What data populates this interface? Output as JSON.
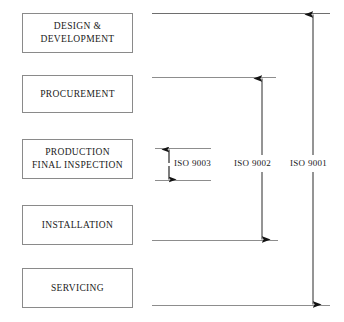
{
  "diagram": {
    "type": "process-scope",
    "process_boxes": [
      {
        "id": "design-development",
        "label": "DESIGN &\nDEVELOPMENT"
      },
      {
        "id": "procurement",
        "label": "PROCUREMENT"
      },
      {
        "id": "production-final-inspection",
        "label": "PRODUCTION\nFINAL INSPECTION"
      },
      {
        "id": "installation",
        "label": "INSTALLATION"
      },
      {
        "id": "servicing",
        "label": "SERVICING"
      }
    ],
    "scope_arrows": [
      {
        "id": "iso-9003",
        "label": "ISO 9003",
        "covers": [
          "PRODUCTION FINAL INSPECTION"
        ],
        "arrowheads": "both"
      },
      {
        "id": "iso-9002",
        "label": "ISO 9002",
        "covers": [
          "PROCUREMENT",
          "PRODUCTION FINAL INSPECTION",
          "INSTALLATION"
        ],
        "arrowheads": "both"
      },
      {
        "id": "iso-9001",
        "label": "ISO 9001",
        "covers": [
          "DESIGN & DEVELOPMENT",
          "PROCUREMENT",
          "PRODUCTION FINAL INSPECTION",
          "INSTALLATION",
          "SERVICING"
        ],
        "arrowheads": "both"
      }
    ],
    "colors": {
      "background": "#ffffff",
      "box_border": "#8a8a8a",
      "rule_line": "#8d8d8d",
      "arrow": "#1a1a1a",
      "text": "#1a1a1a"
    }
  }
}
